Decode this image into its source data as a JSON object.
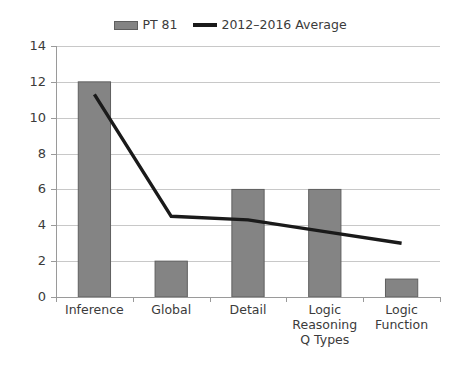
{
  "legend": {
    "position": "top-center",
    "entries": [
      {
        "label": "PT 81",
        "marker": "bar-swatch-icon",
        "color": "#848484"
      },
      {
        "label": "2012–2016 Average",
        "marker": "line-swatch-icon",
        "color": "#1a1a1a"
      }
    ]
  },
  "axis": {
    "y_ticks": [
      "0",
      "2",
      "4",
      "6",
      "8",
      "10",
      "12",
      "14"
    ]
  },
  "categories": {
    "items": [
      "Inference",
      "Global",
      "Detail",
      "Logic Reasoning Q Types",
      "Logic Function"
    ]
  },
  "chart_data": {
    "type": "bar",
    "title": "",
    "subtitle": "",
    "xlabel": "",
    "ylabel": "",
    "ylim": [
      0,
      14
    ],
    "ytick_step": 2,
    "grid": true,
    "legend_position": "top-center",
    "categories": [
      "Inference",
      "Global",
      "Detail",
      "Logic Reasoning Q Types",
      "Logic Function"
    ],
    "series": [
      {
        "name": "PT 81",
        "type": "bar",
        "color": "#848484",
        "values": [
          12,
          2,
          6,
          6,
          1
        ]
      },
      {
        "name": "2012–2016 Average",
        "type": "line",
        "color": "#1a1a1a",
        "values": [
          11.3,
          4.5,
          4.3,
          3.65,
          3.0
        ]
      }
    ]
  }
}
